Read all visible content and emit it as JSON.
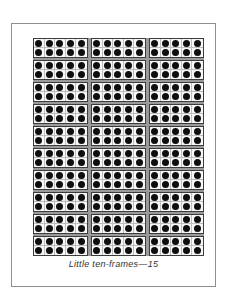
{
  "page": {
    "background": "#ffffff",
    "border_color": "#8f8f8f"
  },
  "caption": "Little ten-frames—15",
  "grid": {
    "columns": 3,
    "rows": 10,
    "frame_count": 30,
    "gap_color": "#9a9a9a"
  },
  "ten_frame": {
    "cols": 5,
    "rows": 2,
    "dots_per_frame": 10,
    "dot_color": "#0e0e0e",
    "border_color": "#3c3c3c",
    "cell_line_color": "#bdbdbd",
    "cell_background": "#f7f7f7"
  }
}
